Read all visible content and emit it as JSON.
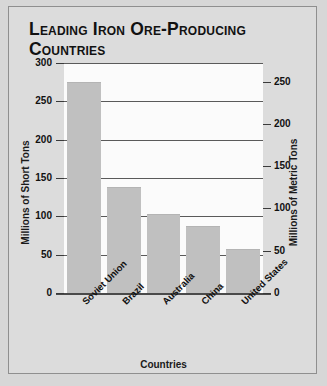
{
  "chart_data": {
    "type": "bar",
    "title": "Leading Iron Ore-Producing Countries",
    "categories": [
      "Soviet Union",
      "Brazil",
      "Australia",
      "China",
      "United States"
    ],
    "values": [
      275,
      138,
      103,
      88,
      57
    ],
    "xlabel": "Countries",
    "ylabel": "Millions of Short Tons",
    "ylabel_secondary": "Millions of Metric Tons",
    "ylim": [
      0,
      300
    ],
    "ylim_secondary": [
      0,
      250
    ],
    "yticks": [
      0,
      50,
      100,
      150,
      200,
      250,
      300
    ],
    "yticks_secondary": [
      0,
      50,
      100,
      150,
      200,
      250
    ],
    "grid": true,
    "legend": false,
    "bar_color": "#c0c0c0",
    "plot_background": "#fbfbfb",
    "figure_background": "#dcdcdc",
    "text_color": "#111111"
  },
  "title_lines": [
    "Leading Iron Ore-Producing",
    "Countries"
  ]
}
